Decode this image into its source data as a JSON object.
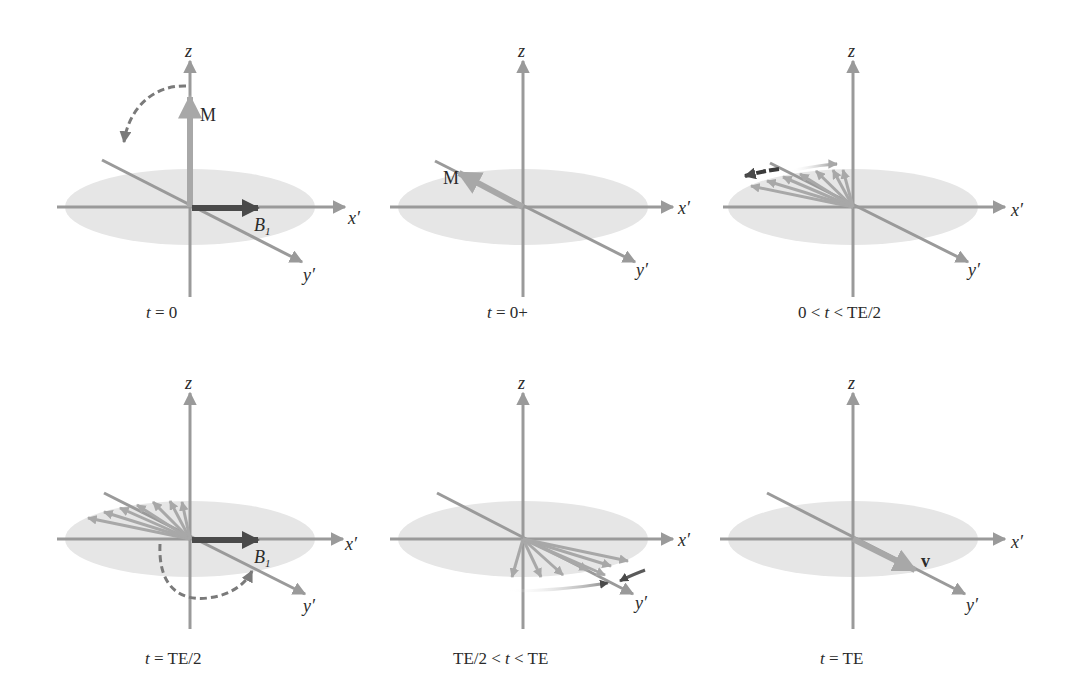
{
  "figure": {
    "colors": {
      "axis": "#9a9a9a",
      "plane": "#e6e6e6",
      "vector": "#a8a8a8",
      "b1": "#4a4a4a",
      "text": "#2a2a2a"
    },
    "axis_labels": {
      "z": "z",
      "x": "x′",
      "y": "y′"
    },
    "panels": [
      {
        "id": "p1",
        "caption": "t = 0",
        "caption_var": "t",
        "caption_rest": " = 0",
        "vector_label": "M",
        "field_label": "B",
        "field_sub": "1"
      },
      {
        "id": "p2",
        "caption": "t = 0+",
        "caption_var": "t",
        "caption_rest": " = 0+",
        "vector_label": "M"
      },
      {
        "id": "p3",
        "caption": "0 < t < TE/2",
        "caption_pre": "0 < ",
        "caption_var": "t",
        "caption_rest": " < TE/2"
      },
      {
        "id": "p4",
        "caption": "t = TE/2",
        "caption_var": "t",
        "caption_rest": " = TE/2",
        "field_label": "B",
        "field_sub": "1"
      },
      {
        "id": "p5",
        "caption": "TE/2 < t < TE",
        "caption_pre": "TE/2 < ",
        "caption_var": "t",
        "caption_rest": " < TE"
      },
      {
        "id": "p6",
        "caption": "t = TE",
        "caption_var": "t",
        "caption_rest": " = TE",
        "vector_label": "v"
      }
    ]
  }
}
